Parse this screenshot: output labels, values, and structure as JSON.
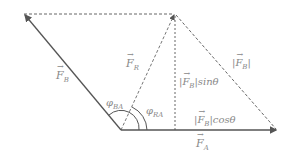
{
  "diagram": {
    "type": "vector-addition",
    "vectors": {
      "FA": {
        "label": "F",
        "sub": "A"
      },
      "FB": {
        "label": "F",
        "sub": "B"
      },
      "FR": {
        "label": "F",
        "sub": "R"
      }
    },
    "labels": {
      "phi_BA_left": {
        "sym": "φ",
        "sub": "BA"
      },
      "phi_RA": {
        "sym": "φ",
        "sub": "RA"
      },
      "mag_FB": {
        "pre": "|",
        "F": "F",
        "sub": "B",
        "post": "|"
      },
      "sin_term": {
        "pre": "|",
        "F": "F",
        "sub": "B",
        "post": "|sinθ"
      },
      "cos_term": {
        "pre": "|",
        "F": "F",
        "sub": "B",
        "post": "|cosθ"
      }
    },
    "colors": {
      "line": "#555555",
      "dashed": "#666666",
      "text": "#888888"
    }
  }
}
